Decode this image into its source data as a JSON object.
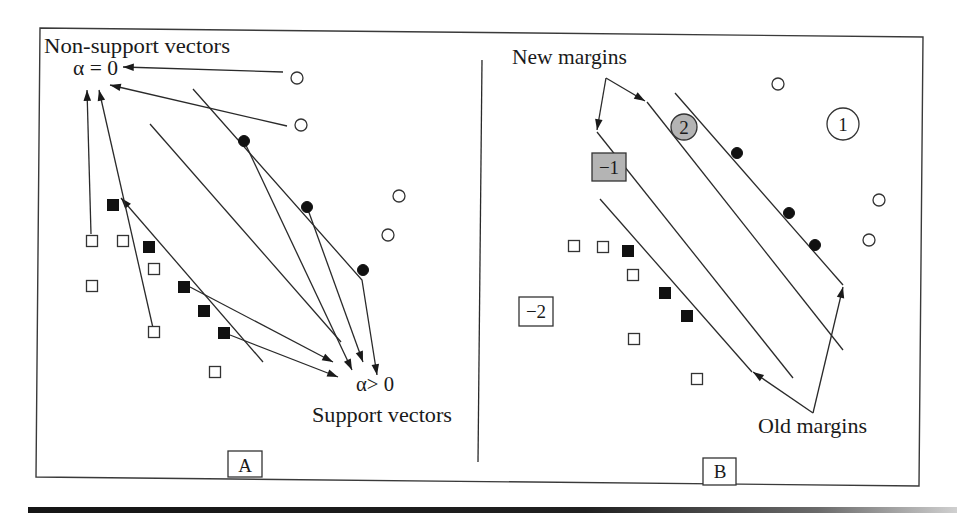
{
  "figure": {
    "panel_a": {
      "label": "A",
      "non_support_title": "Non-support vectors",
      "alpha_zero": "α = 0",
      "alpha_positive": "α> 0",
      "support_title": "Support vectors"
    },
    "panel_b": {
      "label": "B",
      "new_margins": "New margins",
      "old_margins": "Old margins",
      "badge_minus1": "−1",
      "badge_minus2": "−2",
      "badge_2": "2",
      "badge_1": "1"
    }
  },
  "colors": {
    "ink": "#1a1a1a",
    "gray_badge": "#b4b4b4",
    "white": "#ffffff"
  },
  "diagram": {
    "points": [
      {
        "panel": "A",
        "shape": "circle",
        "fill": "open",
        "x": 297,
        "y": 78
      },
      {
        "panel": "A",
        "shape": "circle",
        "fill": "open",
        "x": 301,
        "y": 125
      },
      {
        "panel": "A",
        "shape": "circle",
        "fill": "open",
        "x": 399,
        "y": 196
      },
      {
        "panel": "A",
        "shape": "circle",
        "fill": "open",
        "x": 388,
        "y": 235
      },
      {
        "panel": "A",
        "shape": "circle",
        "fill": "filled",
        "x": 244,
        "y": 141
      },
      {
        "panel": "A",
        "shape": "circle",
        "fill": "filled",
        "x": 307,
        "y": 207
      },
      {
        "panel": "A",
        "shape": "circle",
        "fill": "filled",
        "x": 363,
        "y": 270
      },
      {
        "panel": "A",
        "shape": "square",
        "fill": "open",
        "x": 92,
        "y": 241
      },
      {
        "panel": "A",
        "shape": "square",
        "fill": "open",
        "x": 123,
        "y": 241
      },
      {
        "panel": "A",
        "shape": "square",
        "fill": "open",
        "x": 154,
        "y": 269
      },
      {
        "panel": "A",
        "shape": "square",
        "fill": "open",
        "x": 92,
        "y": 286
      },
      {
        "panel": "A",
        "shape": "square",
        "fill": "open",
        "x": 154,
        "y": 332
      },
      {
        "panel": "A",
        "shape": "square",
        "fill": "open",
        "x": 215,
        "y": 372
      },
      {
        "panel": "A",
        "shape": "square",
        "fill": "filled",
        "x": 113,
        "y": 205
      },
      {
        "panel": "A",
        "shape": "square",
        "fill": "filled",
        "x": 149,
        "y": 247
      },
      {
        "panel": "A",
        "shape": "square",
        "fill": "filled",
        "x": 184,
        "y": 287
      },
      {
        "panel": "A",
        "shape": "square",
        "fill": "filled",
        "x": 204,
        "y": 311
      },
      {
        "panel": "A",
        "shape": "square",
        "fill": "filled",
        "x": 224,
        "y": 333
      },
      {
        "panel": "B",
        "shape": "circle",
        "fill": "open",
        "x": 778,
        "y": 84
      },
      {
        "panel": "B",
        "shape": "circle",
        "fill": "open",
        "x": 879,
        "y": 200
      },
      {
        "panel": "B",
        "shape": "circle",
        "fill": "open",
        "x": 869,
        "y": 240
      },
      {
        "panel": "B",
        "shape": "circle",
        "fill": "filled",
        "x": 737,
        "y": 153
      },
      {
        "panel": "B",
        "shape": "circle",
        "fill": "filled",
        "x": 789,
        "y": 213
      },
      {
        "panel": "B",
        "shape": "circle",
        "fill": "filled",
        "x": 815,
        "y": 245
      },
      {
        "panel": "B",
        "shape": "square",
        "fill": "open",
        "x": 574,
        "y": 246
      },
      {
        "panel": "B",
        "shape": "square",
        "fill": "open",
        "x": 603,
        "y": 247
      },
      {
        "panel": "B",
        "shape": "square",
        "fill": "open",
        "x": 633,
        "y": 275
      },
      {
        "panel": "B",
        "shape": "square",
        "fill": "open",
        "x": 634,
        "y": 339
      },
      {
        "panel": "B",
        "shape": "square",
        "fill": "open",
        "x": 697,
        "y": 379
      },
      {
        "panel": "B",
        "shape": "square",
        "fill": "filled",
        "x": 628,
        "y": 251
      },
      {
        "panel": "B",
        "shape": "square",
        "fill": "filled",
        "x": 665,
        "y": 293
      },
      {
        "panel": "B",
        "shape": "square",
        "fill": "filled",
        "x": 687,
        "y": 316
      }
    ],
    "lines": [
      {
        "name": "hyperplane-a",
        "pts": [
          [
            150,
            124
          ],
          [
            341,
            342
          ]
        ]
      },
      {
        "name": "old-upper-margin-b",
        "pts": [
          [
            675,
            93
          ],
          [
            843,
            285
          ]
        ]
      },
      {
        "name": "new-upper-margin-b",
        "pts": [
          [
            647,
            102
          ],
          [
            843,
            350
          ]
        ]
      },
      {
        "name": "new-lower-margin-b",
        "pts": [
          [
            597,
            132
          ],
          [
            793,
            378
          ]
        ]
      },
      {
        "name": "old-lower-margin-b",
        "pts": [
          [
            600,
            199
          ],
          [
            752,
            372
          ]
        ]
      }
    ],
    "arrows": [
      {
        "name": "upper-margin-a",
        "pts": [
          [
            193,
            89
          ],
          [
            362,
            280
          ],
          [
            377,
            375
          ]
        ]
      },
      {
        "name": "lower-margin-a",
        "pts": [
          [
            263,
            362
          ],
          [
            121,
            198
          ]
        ]
      },
      {
        "name": "arrow-to-alpha-zero",
        "pts": [
          [
            283,
            72
          ],
          [
            123,
            67
          ]
        ]
      },
      {
        "name": "arrow-to-alpha-zero",
        "pts": [
          [
            287,
            126
          ],
          [
            110,
            85
          ]
        ]
      },
      {
        "name": "arrow-to-alpha-zero",
        "pts": [
          [
            91,
            234
          ],
          [
            87,
            90
          ]
        ]
      },
      {
        "name": "arrow-to-alpha-zero",
        "pts": [
          [
            153,
            328
          ],
          [
            99,
            90
          ]
        ]
      },
      {
        "name": "arrow-to-alpha-positive",
        "pts": [
          [
            190,
            287
          ],
          [
            333,
            362
          ]
        ]
      },
      {
        "name": "arrow-to-alpha-positive",
        "pts": [
          [
            230,
            335
          ],
          [
            338,
            377
          ]
        ]
      },
      {
        "name": "arrow-to-alpha-positive",
        "pts": [
          [
            244,
            141
          ],
          [
            352,
            370
          ]
        ]
      },
      {
        "name": "arrow-to-alpha-positive",
        "pts": [
          [
            307,
            207
          ],
          [
            363,
            362
          ]
        ]
      },
      {
        "name": "new-margin-pointer",
        "pts": [
          [
            606,
            78
          ],
          [
            597,
            130
          ]
        ]
      },
      {
        "name": "new-margin-pointer",
        "pts": [
          [
            606,
            78
          ],
          [
            645,
            101
          ]
        ]
      },
      {
        "name": "old-margin-pointer",
        "pts": [
          [
            813,
            413
          ],
          [
            753,
            372
          ]
        ]
      },
      {
        "name": "old-margin-pointer",
        "pts": [
          [
            813,
            413
          ],
          [
            843,
            287
          ]
        ]
      }
    ]
  }
}
